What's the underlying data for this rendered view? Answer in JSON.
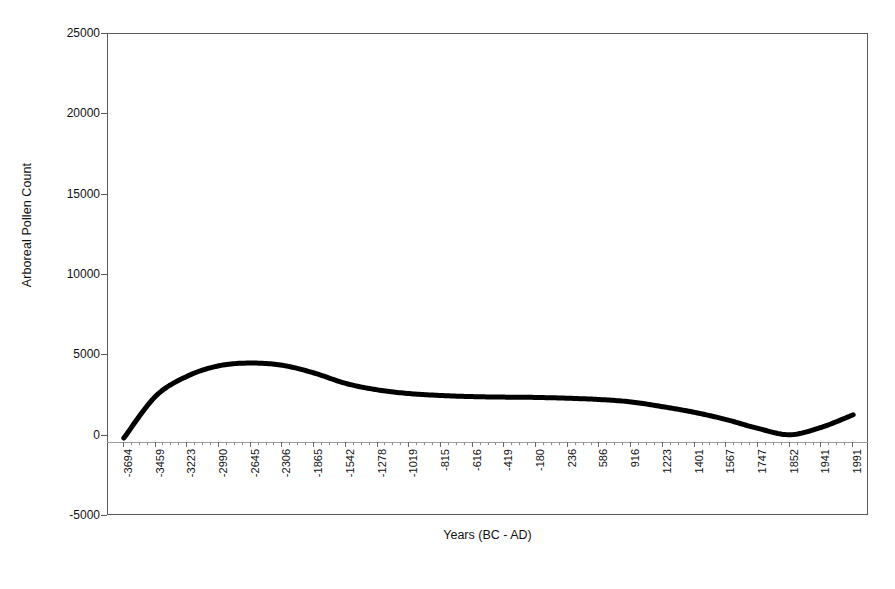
{
  "chart_data": {
    "type": "line",
    "title": "",
    "xlabel": "Years (BC - AD)",
    "ylabel": "Arboreal Pollen Count",
    "ylim": [
      -5000,
      25000
    ],
    "ytick_values": [
      25000,
      20000,
      15000,
      10000,
      5000,
      0,
      -5000
    ],
    "ytick_labels": [
      "25000",
      "20000",
      "15000",
      "10000",
      "5000",
      "0",
      "-5000"
    ],
    "grid": false,
    "legend": "none",
    "categories": [
      "-3694",
      "-3459",
      "-3223",
      "-2990",
      "-2645",
      "-2306",
      "-1865",
      "-1542",
      "-1278",
      "-1019",
      "-815",
      "-616",
      "-419",
      "-180",
      "236",
      "586",
      "916",
      "1223",
      "1401",
      "1567",
      "1747",
      "1852",
      "1941",
      "1991"
    ],
    "series": [
      {
        "name": "Arboreal Pollen Count",
        "color": "#000000",
        "values": [
          -150,
          2450,
          3700,
          4350,
          4520,
          4380,
          3900,
          3250,
          2850,
          2620,
          2500,
          2430,
          2400,
          2380,
          2330,
          2250,
          2100,
          1800,
          1450,
          1000,
          450,
          60,
          520,
          1300
        ]
      }
    ],
    "x_minor_ticks_between": 3
  },
  "axes": {
    "x_title": "Years (BC - AD)",
    "y_title": "Arboreal Pollen Count"
  },
  "caption": {
    "text": ""
  }
}
